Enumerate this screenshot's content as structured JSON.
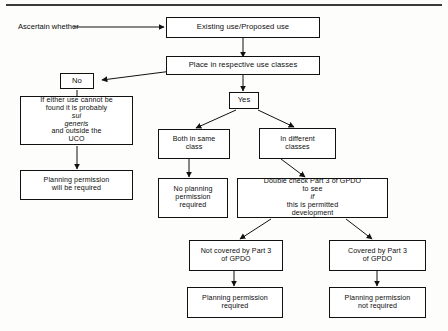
{
  "diagram": {
    "title_rule": true,
    "lead_label": "Ascertain whether",
    "nodes": {
      "existing_use": "Existing use/Proposed use",
      "place_classes": "Place in respective use classes",
      "no": "No",
      "yes": "Yes",
      "sui_generis_pre": "If either use cannot be\nfound it is probably ",
      "sui_generis_it": "sui\ngeneris",
      "sui_generis_post": " and outside the\nUCO",
      "planning_required_left": "Planning permission\nwill be required",
      "both_same_class": "Both in  same\nclass",
      "in_different_classes": "In different\nclasses",
      "no_planning_permission": "No planning\npermission\nrequired",
      "double_check_pre": "Double check Part 3 of GPDO\nto see ",
      "double_check_it": "if",
      "double_check_post": " this is permitted\ndevelopment",
      "not_covered": "Not covered by Part 3\nof GPDO",
      "covered": "Covered by Part 3\nof GPDO",
      "planning_required_bottom_left": "Planning permission\nrequired",
      "planning_not_required_bottom_right": "Planning permission\nnot required"
    },
    "colors": {
      "line": "#111111",
      "text": "#0d0d0d",
      "background": "#fdfdfc",
      "box_fill": "#ffffff"
    }
  }
}
